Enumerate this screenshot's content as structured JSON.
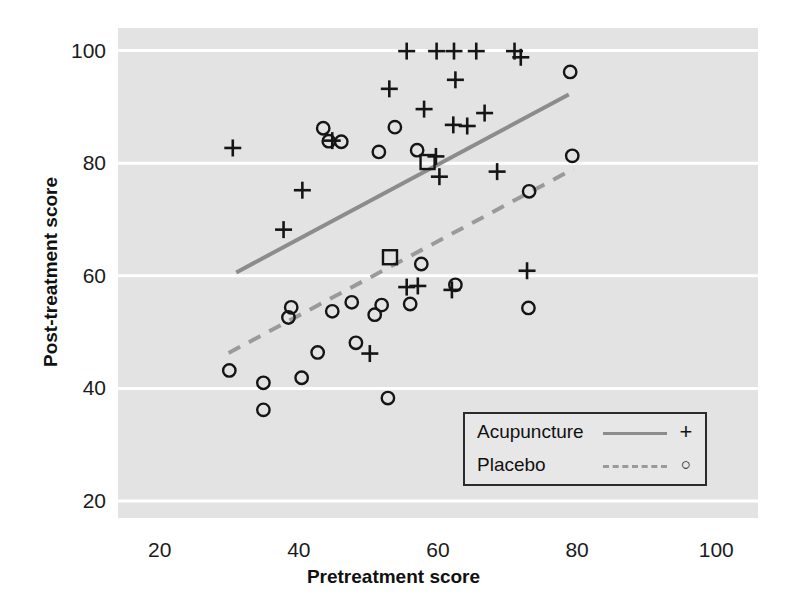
{
  "chart_data": {
    "type": "scatter",
    "title": "",
    "xlabel": "Pretreatment score",
    "ylabel": "Post-treatment score",
    "xlim": [
      14,
      106
    ],
    "ylim": [
      17,
      104
    ],
    "xticks": [
      20,
      40,
      60,
      80,
      100
    ],
    "yticks": [
      20,
      40,
      60,
      80,
      100
    ],
    "grid": "horizontal",
    "panel_background": "#e3e3e3",
    "gridline_color": "#ffffff",
    "legend_position": "bottom-right",
    "series": [
      {
        "name": "Acupuncture",
        "marker": "plus",
        "marker_color": "#151515",
        "line_style": "solid",
        "line_color": "#8c8c8c",
        "points": [
          [
            30.5,
            82.7
          ],
          [
            40.5,
            75.2
          ],
          [
            37.8,
            68.2
          ],
          [
            44.8,
            84.0
          ],
          [
            55.5,
            99.9
          ],
          [
            53.0,
            93.2
          ],
          [
            59.8,
            99.9
          ],
          [
            62.3,
            99.9
          ],
          [
            65.5,
            99.9
          ],
          [
            71.0,
            99.9
          ],
          [
            71.9,
            98.8
          ],
          [
            62.5,
            94.8
          ],
          [
            58.0,
            89.6
          ],
          [
            66.7,
            88.9
          ],
          [
            62.2,
            86.8
          ],
          [
            64.2,
            86.6
          ],
          [
            59.7,
            81.2
          ],
          [
            60.2,
            77.6
          ],
          [
            68.5,
            78.5
          ],
          [
            55.5,
            58.0
          ],
          [
            57.1,
            58.2
          ],
          [
            62.0,
            57.5
          ],
          [
            72.8,
            60.9
          ],
          [
            50.2,
            46.2
          ]
        ],
        "mean_marker": {
          "x": 58.5,
          "y": 80.2,
          "shape": "square"
        },
        "trend_line": {
          "x0": 31.0,
          "y0": 60.6,
          "x1": 78.8,
          "y1": 92.2
        }
      },
      {
        "name": "Placebo",
        "marker": "circle",
        "marker_color": "#151515",
        "line_style": "dashed",
        "line_color": "#9a9a9a",
        "points": [
          [
            43.5,
            86.2
          ],
          [
            44.3,
            83.9
          ],
          [
            46.1,
            83.8
          ],
          [
            51.5,
            82.0
          ],
          [
            53.8,
            86.4
          ],
          [
            57.0,
            82.3
          ],
          [
            79.0,
            96.2
          ],
          [
            79.3,
            81.3
          ],
          [
            73.1,
            75.0
          ],
          [
            73.0,
            54.3
          ],
          [
            62.5,
            58.4
          ],
          [
            57.6,
            62.1
          ],
          [
            56.0,
            55.0
          ],
          [
            51.9,
            54.8
          ],
          [
            50.9,
            53.1
          ],
          [
            47.6,
            55.3
          ],
          [
            44.8,
            53.7
          ],
          [
            38.5,
            52.6
          ],
          [
            38.9,
            54.4
          ],
          [
            42.7,
            46.4
          ],
          [
            48.2,
            48.1
          ],
          [
            34.9,
            41.0
          ],
          [
            34.9,
            36.2
          ],
          [
            40.4,
            41.9
          ],
          [
            30.0,
            43.2
          ],
          [
            52.8,
            38.3
          ]
        ],
        "mean_marker": {
          "x": 53.1,
          "y": 63.3,
          "shape": "square"
        },
        "trend_line": {
          "x0": 29.9,
          "y0": 46.3,
          "x1": 79.5,
          "y1": 79.0
        }
      }
    ],
    "legend": [
      {
        "label": "Acupuncture",
        "line": "solid",
        "marker": "+"
      },
      {
        "label": "Placebo",
        "line": "dashed",
        "marker": "○"
      }
    ]
  }
}
